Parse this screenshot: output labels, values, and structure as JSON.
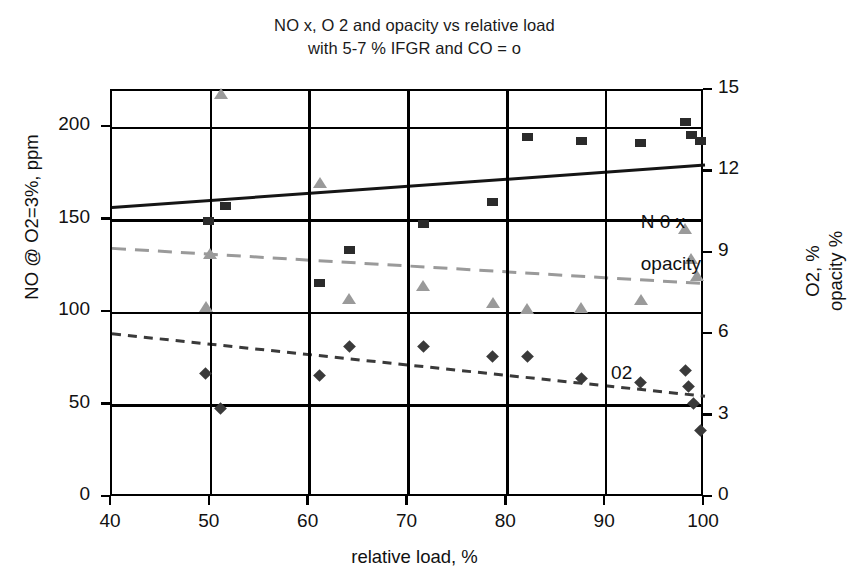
{
  "chart_data": {
    "type": "scatter",
    "title": "NO x, O 2 and opacity vs relative load",
    "subtitle": "with 5-7 % IFGR and CO = o",
    "xlabel": "relative load, %",
    "ylabel_left": "NO @ O2=3%, ppm",
    "ylabel_right_line1": "O2, %",
    "ylabel_right_line2": "opacity %",
    "xlim": [
      40,
      100
    ],
    "ylim_left": [
      0,
      220
    ],
    "ylim_right": [
      0,
      15
    ],
    "xticks": [
      "40",
      "50",
      "60",
      "70",
      "80",
      "90",
      "100"
    ],
    "xtick_values": [
      40,
      50,
      60,
      70,
      80,
      90,
      100
    ],
    "yticks_left": [
      "0",
      "50",
      "100",
      "150",
      "200"
    ],
    "ytick_values_left": [
      0,
      50,
      100,
      150,
      200
    ],
    "yticks_right": [
      "0",
      "3",
      "6",
      "9",
      "12",
      "15"
    ],
    "ytick_values_right": [
      0,
      3,
      6,
      9,
      12,
      15
    ],
    "grid": true,
    "legend_position": "inline-annotations",
    "annotations": [
      {
        "text": "N 0 x",
        "x": 93.5,
        "y_right": 10.1,
        "series": "nox"
      },
      {
        "text": "opacity",
        "x": 93.5,
        "y_right": 8.55,
        "series": "opacity"
      },
      {
        "text": "02",
        "x": 90.5,
        "y_right": 4.55,
        "series": "o2"
      }
    ],
    "series": [
      {
        "name": "N 0 x",
        "marker": "square",
        "color": "#2b2b2b",
        "axis": "left",
        "unit": "ppm",
        "points": [
          {
            "x": 49.8,
            "y": 150
          },
          {
            "x": 51.5,
            "y": 158
          },
          {
            "x": 61.0,
            "y": 116
          },
          {
            "x": 64.0,
            "y": 134
          },
          {
            "x": 71.5,
            "y": 148
          },
          {
            "x": 78.5,
            "y": 160
          },
          {
            "x": 82.0,
            "y": 195
          },
          {
            "x": 87.5,
            "y": 193
          },
          {
            "x": 93.5,
            "y": 192
          },
          {
            "x": 98.0,
            "y": 203
          },
          {
            "x": 98.6,
            "y": 196
          },
          {
            "x": 99.5,
            "y": 193
          }
        ],
        "trend": {
          "style": "solid",
          "x0": 40,
          "y0": 157,
          "x1": 100,
          "y1": 180
        }
      },
      {
        "name": "opacity",
        "marker": "triangle",
        "color": "#9a9a9a",
        "axis": "right",
        "unit": "%",
        "points": [
          {
            "x": 51.0,
            "y": 14.9
          },
          {
            "x": 49.5,
            "y": 7.05
          },
          {
            "x": 49.9,
            "y": 9.0
          },
          {
            "x": 61.0,
            "y": 11.6
          },
          {
            "x": 64.0,
            "y": 7.35
          },
          {
            "x": 71.5,
            "y": 7.8
          },
          {
            "x": 78.5,
            "y": 7.2
          },
          {
            "x": 82.0,
            "y": 6.95
          },
          {
            "x": 87.5,
            "y": 7.0
          },
          {
            "x": 93.5,
            "y": 7.3
          },
          {
            "x": 98.0,
            "y": 9.9
          },
          {
            "x": 98.6,
            "y": 8.8
          },
          {
            "x": 99.2,
            "y": 8.2
          }
        ],
        "trend": {
          "style": "dashed-long",
          "x0": 40,
          "y0": 9.2,
          "x1": 100,
          "y1": 7.9
        }
      },
      {
        "name": "02",
        "marker": "diamond",
        "color": "#3a3a3a",
        "axis": "right",
        "unit": "%",
        "points": [
          {
            "x": 49.5,
            "y": 4.6
          },
          {
            "x": 51.0,
            "y": 3.3
          },
          {
            "x": 61.0,
            "y": 4.5
          },
          {
            "x": 64.0,
            "y": 5.6
          },
          {
            "x": 71.5,
            "y": 5.6
          },
          {
            "x": 78.5,
            "y": 5.2
          },
          {
            "x": 82.0,
            "y": 5.2
          },
          {
            "x": 87.5,
            "y": 4.4
          },
          {
            "x": 93.5,
            "y": 4.25
          },
          {
            "x": 98.0,
            "y": 4.7
          },
          {
            "x": 98.3,
            "y": 4.1
          },
          {
            "x": 98.8,
            "y": 3.5
          },
          {
            "x": 99.5,
            "y": 2.5
          }
        ],
        "trend": {
          "style": "dashed-short",
          "x0": 40,
          "y0": 6.05,
          "x1": 100,
          "y1": 3.75
        }
      }
    ]
  }
}
